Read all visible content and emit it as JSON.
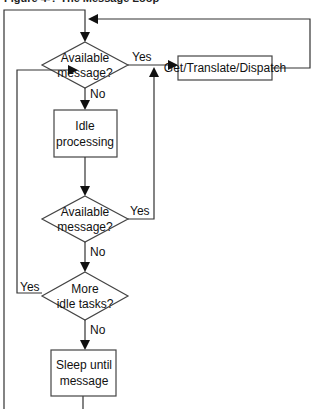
{
  "title": "Figure 4-? The Message Loop",
  "nodes": {
    "decision1": {
      "lines": [
        "Available",
        "message?"
      ]
    },
    "dispatch": {
      "label": "Get/Translate/Dispatch"
    },
    "idle": {
      "lines": [
        "Idle",
        "processing"
      ]
    },
    "decision2": {
      "lines": [
        "Available",
        "message?"
      ]
    },
    "decision3": {
      "lines": [
        "More",
        "idle tasks?"
      ]
    },
    "sleep": {
      "lines": [
        "Sleep until",
        "message"
      ]
    }
  },
  "edges": {
    "d1_yes": "Yes",
    "d1_no": "No",
    "d2_yes": "Yes",
    "d2_no": "No",
    "d3_yes": "Yes",
    "d3_no": "No"
  }
}
